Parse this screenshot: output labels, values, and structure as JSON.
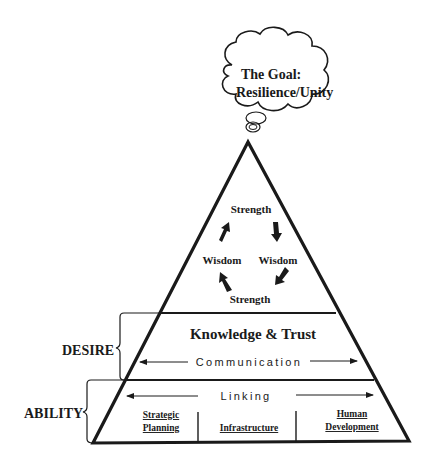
{
  "goal_cloud": {
    "line1": "The Goal:",
    "line2": "Resilience/Unity"
  },
  "cycle": {
    "top": "Strength",
    "left": "Wisdom",
    "right": "Wisdom",
    "bottom": "Strength"
  },
  "middle_tier": {
    "title": "Knowledge & Trust",
    "arrow_label": "Communication"
  },
  "bottom_tier": {
    "arrow_label": "Linking",
    "columns": [
      {
        "line1": "Strategic",
        "line2": "Planning"
      },
      {
        "line1": "Infrastructure"
      },
      {
        "line1": "Human",
        "line2": "Development"
      }
    ]
  },
  "brackets": {
    "desire": "DESIRE",
    "ability": "ABILITY"
  },
  "colors": {
    "stroke": "#1a1a1a",
    "background": "#ffffff"
  }
}
